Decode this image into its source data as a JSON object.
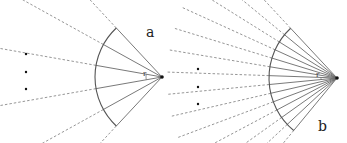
{
  "panels": [
    {
      "id": "a",
      "label": "a",
      "apex": [
        162,
        77
      ],
      "radius": 67,
      "dash_length": 165,
      "angles_deg": [
        133,
        151,
        170,
        190,
        209,
        227
      ],
      "dots": [
        [
          26,
          54
        ],
        [
          26,
          72
        ],
        [
          26,
          89
        ]
      ],
      "r_label": "r",
      "label_pos": [
        146,
        24
      ],
      "r_pos": [
        142,
        71
      ]
    },
    {
      "id": "b",
      "label": "b",
      "apex": [
        337,
        78
      ],
      "radius": 68,
      "dash_length": 170,
      "angles_deg": [
        133,
        140.5,
        148,
        155.5,
        163,
        170.5,
        178,
        185.5,
        193,
        200.5,
        208,
        215.5,
        223,
        230.5
      ],
      "dots": [
        [
          198,
          69
        ],
        [
          198,
          87
        ],
        [
          198,
          104
        ]
      ],
      "r_label": "r",
      "label_pos": [
        318,
        118
      ],
      "r_pos": [
        315,
        72
      ]
    }
  ],
  "colors": {
    "solid_line": "#6a6a6a",
    "dashed_line": "#8a8a8a",
    "arc": "#555555",
    "dot": "#111111",
    "text": "#222222"
  }
}
